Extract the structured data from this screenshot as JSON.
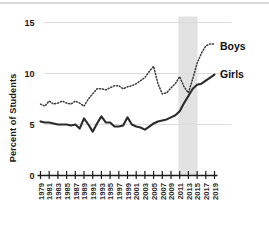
{
  "chart_data": {
    "type": "line",
    "title": "",
    "subtitle": "",
    "xlabel": "",
    "ylabel": "Percent of Students",
    "ylim": [
      0,
      15
    ],
    "xlim": [
      1979,
      2019
    ],
    "yticks": [
      0,
      5,
      10,
      15
    ],
    "ytick_labels": [
      "0",
      "5",
      "10",
      "15"
    ],
    "grid": "horizontal",
    "gridlines_at": [
      5,
      10,
      15
    ],
    "legend_position": "right-inline",
    "x": [
      1979,
      1980,
      1981,
      1982,
      1983,
      1984,
      1985,
      1986,
      1987,
      1988,
      1989,
      1990,
      1991,
      1992,
      1993,
      1994,
      1995,
      1996,
      1997,
      1998,
      1999,
      2000,
      2001,
      2002,
      2003,
      2004,
      2005,
      2006,
      2007,
      2008,
      2009,
      2010,
      2011,
      2012,
      2013,
      2014,
      2015,
      2016,
      2017,
      2018,
      2019
    ],
    "xtick_labels": [
      "1979",
      "1981",
      "1983",
      "1985",
      "1987",
      "1989",
      "1991",
      "1993",
      "1995",
      "1997",
      "1999",
      "2001",
      "2003",
      "2005",
      "2007",
      "2009",
      "2011",
      "2013",
      "2015",
      "2017",
      "2019"
    ],
    "series": [
      {
        "name": "Boys",
        "style": "dotted",
        "color": "#3a3a3a",
        "values": [
          7.0,
          6.8,
          7.3,
          7.0,
          7.1,
          7.3,
          7.1,
          7.0,
          7.3,
          7.1,
          6.8,
          7.5,
          8.0,
          8.5,
          8.5,
          8.4,
          8.6,
          8.8,
          8.8,
          8.5,
          8.7,
          8.8,
          9.0,
          9.3,
          9.6,
          10.2,
          10.7,
          9.0,
          8.0,
          8.1,
          8.6,
          9.0,
          9.7,
          8.7,
          8.1,
          9.5,
          11.0,
          12.0,
          12.7,
          12.9,
          12.9
        ]
      },
      {
        "name": "Girls",
        "style": "solid",
        "color": "#2b2b2b",
        "values": [
          5.3,
          5.2,
          5.2,
          5.1,
          5.0,
          5.0,
          5.0,
          4.9,
          5.0,
          4.6,
          5.6,
          5.0,
          4.3,
          5.1,
          5.8,
          5.2,
          5.2,
          4.8,
          4.8,
          4.9,
          5.7,
          5.0,
          4.8,
          4.7,
          4.5,
          4.8,
          5.1,
          5.3,
          5.4,
          5.5,
          5.7,
          5.9,
          6.3,
          7.1,
          7.8,
          8.5,
          8.9,
          9.0,
          9.3,
          9.6,
          9.9
        ]
      }
    ],
    "shaded_band": {
      "label": "",
      "x_start": 2010.7,
      "x_end": 2015.1,
      "color": "#e2e2e2"
    },
    "annotations": [
      {
        "text": "Boys",
        "x": 2019.8,
        "y": 12.6
      },
      {
        "text": "Girls",
        "x": 2019.8,
        "y": 9.9
      }
    ]
  }
}
